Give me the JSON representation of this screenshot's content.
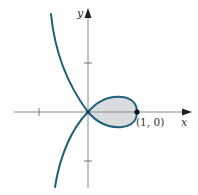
{
  "diagram": {
    "type": "parametric-curve-with-loop",
    "axes": {
      "x_label": "x",
      "y_label": "y",
      "ticks": {
        "x": [
          -1
        ],
        "y": [
          1,
          -1
        ]
      }
    },
    "points": [
      {
        "label": "(1, 0)",
        "x": 1,
        "y": 0
      }
    ],
    "shaded_region": "loop between (0, 0) and (1, 0)",
    "colors": {
      "curve": "#1f5f7a",
      "fill": "#d9dde0",
      "axis": "#8a8a8a",
      "point": "#111111"
    }
  }
}
